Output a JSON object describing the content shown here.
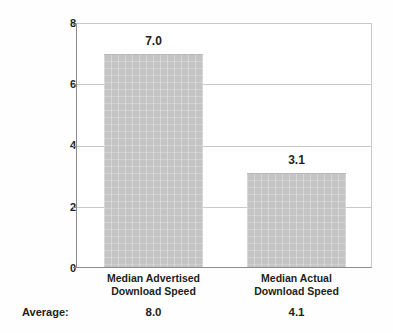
{
  "chart_data": {
    "type": "bar",
    "title": "",
    "xlabel": "",
    "ylabel": "",
    "ylim": [
      0,
      8
    ],
    "yticks": [
      "0",
      "2",
      "4",
      "6",
      "8"
    ],
    "grid": true,
    "legend": "none",
    "categories": [
      "Median Advertised\nDownload Speed",
      "Median Actual\nDownload Speed"
    ],
    "category_lines": [
      [
        "Median Advertised",
        "Download Speed"
      ],
      [
        "Median Actual",
        "Download Speed"
      ]
    ],
    "values": [
      7.0,
      3.1
    ],
    "value_labels": [
      "7.0",
      "3.1"
    ],
    "annotations": {
      "average_row_label": "Average:",
      "average_values": [
        "8.0",
        "4.1"
      ]
    }
  },
  "colors": {
    "bar_fill": "#c4c4c4",
    "gridline": "#c9c9c9",
    "axis": "#8c8c8c",
    "text": "#231f20",
    "background": "#fefefe"
  }
}
